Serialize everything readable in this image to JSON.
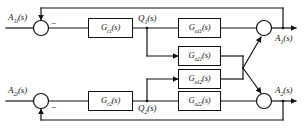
{
  "diagram": {
    "line_color": "#111111",
    "background": "#ffffff"
  },
  "inputs": [
    {
      "id": "a1i",
      "label": "A",
      "sub": "1i",
      "suffix": "(s)"
    },
    {
      "id": "a2i",
      "label": "A",
      "sub": "2i",
      "suffix": "(s)"
    }
  ],
  "outputs": [
    {
      "id": "a1",
      "label": "A",
      "sub": "1",
      "suffix": "(s)"
    },
    {
      "id": "a2",
      "label": "A",
      "sub": "2",
      "suffix": "(s)"
    }
  ],
  "signals": [
    {
      "id": "q1",
      "label": "Q",
      "sub": "1",
      "suffix": "(s)"
    },
    {
      "id": "q2",
      "label": "Q",
      "sub": "2",
      "suffix": "(s)"
    }
  ],
  "blocks": [
    {
      "id": "gc1",
      "label": "G",
      "sub": "c1",
      "suffix": "(s)"
    },
    {
      "id": "gc2",
      "label": "G",
      "sub": "c2",
      "suffix": "(s)"
    },
    {
      "id": "go11",
      "label": "G",
      "sub": "o11",
      "suffix": "(s)"
    },
    {
      "id": "go21",
      "label": "G",
      "sub": "o21",
      "suffix": "(s)"
    },
    {
      "id": "go12",
      "label": "G",
      "sub": "o12",
      "suffix": "(s)"
    },
    {
      "id": "go22",
      "label": "G",
      "sub": "o22",
      "suffix": "(s)"
    }
  ],
  "summers": [
    {
      "id": "sum-in-1",
      "signs": [
        "-"
      ]
    },
    {
      "id": "sum-in-2",
      "signs": [
        "-"
      ]
    },
    {
      "id": "sum-out-1",
      "signs": []
    },
    {
      "id": "sum-out-2",
      "signs": []
    }
  ],
  "sign_marks": [
    {
      "id": "minus-top",
      "text": "−"
    },
    {
      "id": "minus-bottom",
      "text": "−"
    }
  ]
}
